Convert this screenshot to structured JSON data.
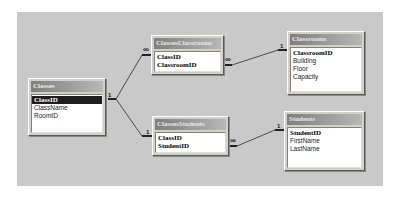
{
  "diagram": {
    "tables": [
      {
        "id": "classes",
        "name": "Classes",
        "fields": [
          {
            "name": "ClassID",
            "primary_key": true,
            "selected": true
          },
          {
            "name": "ClassName",
            "primary_key": false,
            "selected": false
          },
          {
            "name": "RoomID",
            "primary_key": false,
            "selected": false
          }
        ]
      },
      {
        "id": "classes_classrooms",
        "name": "ClassesClassrooms",
        "fields": [
          {
            "name": "ClassID",
            "primary_key": true,
            "selected": false
          },
          {
            "name": "ClassroomID",
            "primary_key": true,
            "selected": false
          }
        ]
      },
      {
        "id": "classrooms",
        "name": "Classrooms",
        "fields": [
          {
            "name": "ClassroomID",
            "primary_key": true,
            "selected": false
          },
          {
            "name": "Building",
            "primary_key": false,
            "selected": false
          },
          {
            "name": "Floor",
            "primary_key": false,
            "selected": false
          },
          {
            "name": "Capacity",
            "primary_key": false,
            "selected": false
          }
        ]
      },
      {
        "id": "classes_students",
        "name": "ClassesStudents",
        "fields": [
          {
            "name": "ClassID",
            "primary_key": true,
            "selected": false
          },
          {
            "name": "StudentID",
            "primary_key": true,
            "selected": false
          }
        ]
      },
      {
        "id": "students",
        "name": "Students",
        "fields": [
          {
            "name": "StudentID",
            "primary_key": true,
            "selected": false
          },
          {
            "name": "FirstName",
            "primary_key": false,
            "selected": false
          },
          {
            "name": "LastName",
            "primary_key": false,
            "selected": false
          }
        ]
      }
    ],
    "relationships": [
      {
        "from": "classes",
        "to": "classes_classrooms",
        "from_card": "1",
        "to_card": "∞"
      },
      {
        "from": "classes",
        "to": "classes_students",
        "from_card": "1",
        "to_card": "1"
      },
      {
        "from": "classes_classrooms",
        "to": "classrooms",
        "from_card": "∞",
        "to_card": "1"
      },
      {
        "from": "classes_students",
        "to": "students",
        "from_card": "∞",
        "to_card": "1"
      }
    ]
  },
  "colors": {
    "canvas": "#c9c9c9",
    "header_start": "#7f7f7f",
    "header_end": "#b7b7b7",
    "selected_row": "#1e1e1e",
    "line": "#4a4a4a"
  }
}
